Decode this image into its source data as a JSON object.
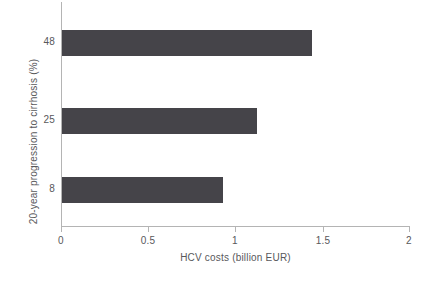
{
  "chart_data": {
    "type": "bar",
    "orientation": "horizontal",
    "title": "",
    "subtitle": "",
    "xlabel": "HCV costs (billion EUR)",
    "ylabel": "20-year progression to cirrhosis (%)",
    "categories": [
      "8",
      "25",
      "48"
    ],
    "values": [
      0.92,
      1.12,
      1.43
    ],
    "series": [
      {
        "name": "HCV costs",
        "values": [
          0.92,
          1.12,
          1.43
        ],
        "color": "#454449"
      }
    ],
    "xlim": [
      0,
      2
    ],
    "xticks": [
      0,
      0.5,
      1,
      1.5,
      2
    ],
    "xtick_labels": [
      "0",
      "0.5",
      "1",
      "1.5",
      "2"
    ],
    "ytick_labels": [
      "48",
      "25",
      "8"
    ],
    "grid": false,
    "legend": false,
    "legend_position": "none",
    "bar_color": "#454449",
    "axis_color": "#b4b4b4",
    "text_color": "#58585b",
    "background": "#ffffff",
    "bars": [
      {
        "category": "48",
        "value": 1.43,
        "label": "48"
      },
      {
        "category": "25",
        "value": 1.12,
        "label": "25"
      },
      {
        "category": "8",
        "value": 0.92,
        "label": "8"
      }
    ]
  }
}
